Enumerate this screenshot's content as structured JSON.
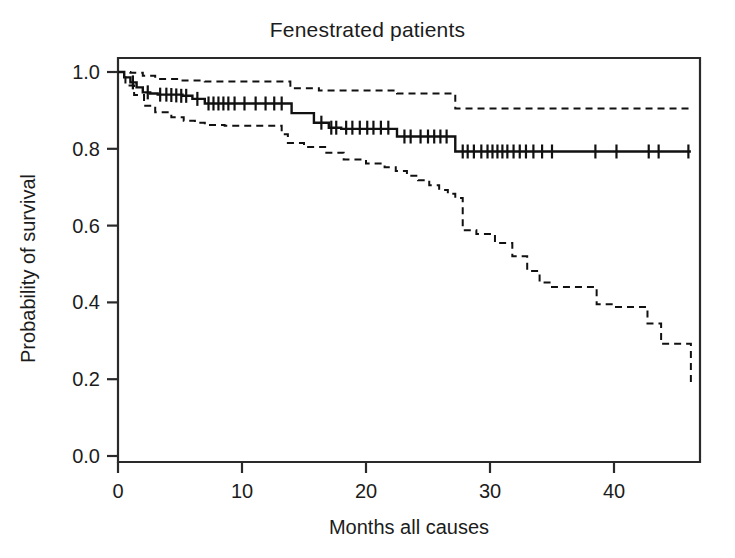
{
  "chart_data": {
    "type": "line",
    "chart_kind": "kaplan-meier-survival",
    "title": "Fenestrated patients",
    "xlabel": "Months all causes",
    "ylabel": "Probability of survival",
    "xlim": [
      0,
      47
    ],
    "ylim": [
      0.0,
      1.05
    ],
    "xticks": [
      0,
      10,
      20,
      30,
      40
    ],
    "xtick_labels": [
      "0",
      "10",
      "20",
      "30",
      "40"
    ],
    "yticks": [
      0.0,
      0.2,
      0.4,
      0.6,
      0.8,
      1.0
    ],
    "ytick_labels": [
      "0.0",
      "0.2",
      "0.4",
      "0.6",
      "0.8",
      "1.0"
    ],
    "grid": false,
    "legend": false,
    "legend_position": "none",
    "line_color": "#111111",
    "series": [
      {
        "name": "Survival estimate",
        "style": "solid",
        "step": "post",
        "x": [
          0,
          0.5,
          1.0,
          1.5,
          2.0,
          2.6,
          3.2,
          5.2,
          6.0,
          7.0,
          13.6,
          14.0,
          15.8,
          17.0,
          18.0,
          22.5,
          27.2,
          46.2
        ],
        "y": [
          1.0,
          0.986,
          0.973,
          0.96,
          0.947,
          0.944,
          0.941,
          0.938,
          0.93,
          0.918,
          0.918,
          0.893,
          0.868,
          0.855,
          0.852,
          0.832,
          0.793,
          0.793
        ],
        "censor_x": [
          1.2,
          2.4,
          3.4,
          3.9,
          4.3,
          4.7,
          5.1,
          5.5,
          6.4,
          7.3,
          7.7,
          8.1,
          8.5,
          8.9,
          9.4,
          10.2,
          11.1,
          11.9,
          12.6,
          13.2,
          16.4,
          17.2,
          17.6,
          18.4,
          18.9,
          19.5,
          20.1,
          20.6,
          21.2,
          21.8,
          23.1,
          23.6,
          24.4,
          25.0,
          25.5,
          26.0,
          26.5,
          27.8,
          28.2,
          28.7,
          29.3,
          29.8,
          30.2,
          30.6,
          31.0,
          31.4,
          31.9,
          32.4,
          32.9,
          33.5,
          34.2,
          35.0,
          38.5,
          40.2,
          42.8,
          43.6,
          46.0
        ],
        "censor_y": [
          0.973,
          0.947,
          0.941,
          0.941,
          0.94,
          0.939,
          0.938,
          0.938,
          0.93,
          0.918,
          0.918,
          0.918,
          0.918,
          0.918,
          0.918,
          0.918,
          0.918,
          0.918,
          0.918,
          0.918,
          0.868,
          0.855,
          0.855,
          0.855,
          0.855,
          0.855,
          0.855,
          0.855,
          0.855,
          0.855,
          0.832,
          0.832,
          0.832,
          0.832,
          0.832,
          0.832,
          0.832,
          0.793,
          0.793,
          0.793,
          0.793,
          0.793,
          0.793,
          0.793,
          0.793,
          0.793,
          0.793,
          0.793,
          0.793,
          0.793,
          0.793,
          0.793,
          0.793,
          0.793,
          0.793,
          0.793,
          0.793
        ]
      },
      {
        "name": "Upper 95% confidence limit",
        "style": "dashed",
        "step": "post",
        "x": [
          0,
          1.0,
          2.0,
          3.0,
          5.0,
          7.0,
          13.2,
          13.9,
          16.2,
          22.5,
          27.2,
          46.2
        ],
        "y": [
          1.0,
          0.998,
          0.99,
          0.982,
          0.978,
          0.975,
          0.975,
          0.958,
          0.952,
          0.944,
          0.905,
          0.905
        ]
      },
      {
        "name": "Lower 95% confidence limit",
        "style": "dashed",
        "step": "post",
        "x": [
          0,
          0.6,
          1.3,
          2.1,
          3.0,
          4.3,
          5.3,
          6.2,
          7.0,
          8.6,
          12.2,
          13.2,
          13.7,
          15.0,
          16.8,
          18.2,
          20.0,
          21.5,
          22.4,
          23.3,
          24.2,
          25.1,
          25.9,
          26.6,
          27.2,
          27.8,
          28.9,
          30.4,
          31.8,
          33.0,
          34.0,
          35.0,
          36.3,
          37.6,
          38.6,
          40.0,
          41.3,
          42.7,
          43.8,
          44.7,
          45.4,
          46.2
        ],
        "y": [
          1.0,
          0.965,
          0.94,
          0.912,
          0.895,
          0.882,
          0.873,
          0.868,
          0.862,
          0.86,
          0.86,
          0.838,
          0.815,
          0.805,
          0.79,
          0.772,
          0.762,
          0.752,
          0.742,
          0.73,
          0.718,
          0.705,
          0.693,
          0.683,
          0.672,
          0.588,
          0.578,
          0.555,
          0.52,
          0.482,
          0.452,
          0.44,
          0.44,
          0.44,
          0.395,
          0.388,
          0.388,
          0.345,
          0.292,
          0.292,
          0.292,
          0.192
        ]
      }
    ]
  },
  "axes": {
    "title": "Fenestrated patients",
    "x_label": "Months all causes",
    "y_label": "Probability of survival",
    "x_tick_labels": [
      "0",
      "10",
      "20",
      "30",
      "40"
    ],
    "y_tick_labels": [
      "1.0",
      "0.8",
      "0.6",
      "0.4",
      "0.2",
      "0.0"
    ]
  },
  "style": {
    "background": "#ffffff",
    "axis_color": "#2a2a2a",
    "curve_color": "#111111"
  }
}
